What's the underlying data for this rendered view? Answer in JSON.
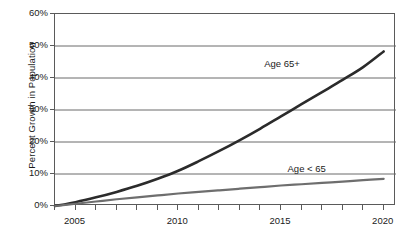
{
  "chart_data": {
    "type": "line",
    "title": "",
    "subtitle": "",
    "xlabel": "",
    "ylabel": "Percent Growth in Population",
    "xlim": [
      2004,
      2020.6
    ],
    "ylim": [
      0,
      60
    ],
    "grid": true,
    "grid_axis": "y",
    "legend_position": "inline-annotations",
    "y_ticks": [
      0,
      10,
      20,
      30,
      40,
      50,
      60
    ],
    "y_tick_labels": [
      "0%",
      "10%",
      "20%",
      "30%",
      "40%",
      "50%",
      "60%"
    ],
    "x_ticks": [
      2004,
      2005,
      2006,
      2007,
      2008,
      2009,
      2010,
      2011,
      2012,
      2013,
      2014,
      2015,
      2016,
      2017,
      2018,
      2019,
      2020
    ],
    "x_tick_labels_shown": [
      "2005",
      "2010",
      "2015",
      "2020"
    ],
    "x_tick_label_values": [
      2005,
      2010,
      2015,
      2020
    ],
    "x": [
      2004,
      2005,
      2006,
      2007,
      2008,
      2009,
      2010,
      2011,
      2012,
      2013,
      2014,
      2015,
      2016,
      2017,
      2018,
      2019,
      2020
    ],
    "series": [
      {
        "name": "Age 65+",
        "color": "#2b2b2b",
        "width": 2.6,
        "label_x": 2015.1,
        "label_y": 44.0,
        "values": [
          0,
          1.2,
          2.7,
          4.4,
          6.3,
          8.5,
          11.0,
          14.0,
          17.2,
          20.6,
          24.2,
          28.0,
          31.8,
          35.6,
          39.4,
          43.4,
          48.3
        ]
      },
      {
        "name": "Age < 65",
        "color": "#6e6e6e",
        "width": 2.2,
        "label_x": 2016.3,
        "label_y": 11.4,
        "values": [
          0,
          0.7,
          1.4,
          2.1,
          2.7,
          3.3,
          3.9,
          4.4,
          4.9,
          5.4,
          5.9,
          6.4,
          6.8,
          7.2,
          7.6,
          8.1,
          8.5
        ]
      }
    ],
    "annotations": [
      {
        "text": "Age 65+",
        "series": "Age 65+"
      },
      {
        "text": "Age < 65",
        "series": "Age < 65"
      }
    ]
  },
  "axes": {
    "frame_color": "#5a5a5a",
    "gridline_color": "#6a6a6a",
    "tick_color": "#5a5a5a"
  }
}
